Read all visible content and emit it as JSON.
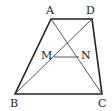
{
  "figure": {
    "type": "trapezoid",
    "points": {
      "A": {
        "label": "A",
        "x": 51,
        "y": 19
      },
      "D": {
        "label": "D",
        "x": 92,
        "y": 19
      },
      "B": {
        "label": "B",
        "x": 15,
        "y": 94
      },
      "C": {
        "label": "C",
        "x": 102,
        "y": 94
      },
      "M": {
        "label": "M",
        "x": 54,
        "y": 57
      },
      "N": {
        "label": "N",
        "x": 79,
        "y": 57
      }
    },
    "edges": [
      "AD",
      "AB",
      "DC",
      "BC"
    ],
    "diagonals": [
      "AC",
      "BD"
    ],
    "segments": [
      "MN"
    ],
    "stroke_color": "#222222",
    "thin_color": "#444444"
  }
}
